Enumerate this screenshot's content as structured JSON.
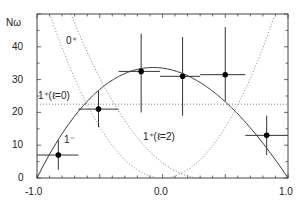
{
  "chart_data": {
    "type": "scatter",
    "title": "",
    "xlabel": "",
    "ylabel": "Nω",
    "xlim": [
      -1.0,
      1.0
    ],
    "ylim": [
      0,
      50
    ],
    "x_ticks": [
      "-1.0",
      "0.0",
      "1.0"
    ],
    "y_ticks": [
      "0",
      "10",
      "20",
      "30",
      "40"
    ],
    "grid": false,
    "legend": null,
    "series": [
      {
        "name": "data",
        "style": "points-with-errorbars",
        "x": [
          -0.83,
          -0.51,
          -0.17,
          0.16,
          0.5,
          0.83
        ],
        "y": [
          7,
          21,
          32.5,
          31,
          31.5,
          13
        ],
        "x_err_low": [
          -1.0,
          -0.67,
          -0.35,
          -0.02,
          0.3,
          0.66
        ],
        "x_err_high": [
          -0.67,
          -0.35,
          -0.02,
          0.3,
          0.66,
          1.0
        ],
        "y_err_low": [
          2.5,
          15.5,
          20,
          19,
          23.5,
          7
        ],
        "y_err_high": [
          11.5,
          26.5,
          44,
          43,
          46,
          19
        ]
      },
      {
        "name": "1⁻",
        "style": "solid",
        "function": "33.5*(1-w^2) skewed, zero at ±1, peak ≈33.5 near w=-0.15"
      },
      {
        "name": "0⁺",
        "style": "dotted",
        "function": "rises steeply toward w=-1, falls to 0 near w≈0.3"
      },
      {
        "name": "1⁺(ℓ=0)",
        "style": "dotted",
        "constant": 22.5
      },
      {
        "name": "1⁺(ℓ=2)",
        "style": "dotted",
        "function": "parabola ~ w^2 shape, minimum 0 near w=0, rising to ~50 at w≈±0.9"
      }
    ],
    "annotations": [
      {
        "text": "0⁺",
        "x": -0.68,
        "y": 43
      },
      {
        "text": "1⁺(ℓ=0)",
        "x": -0.99,
        "y": 24.5
      },
      {
        "text": "1⁻",
        "x": -0.78,
        "y": 11.5
      },
      {
        "text": "1⁺(ℓ=2)",
        "x": -0.15,
        "y": 12.5
      }
    ]
  },
  "axes": {
    "y_label": "Nω",
    "x_tick_labels": [
      "-1.0",
      "0.0",
      "1.0"
    ],
    "y_tick_labels": [
      "0",
      "10",
      "20",
      "30",
      "40"
    ]
  },
  "labels": {
    "zero_plus": "0⁺",
    "one_plus_l0": "1⁺(ℓ=0)",
    "one_minus": "1⁻",
    "one_plus_l2": "1⁺(ℓ=2)"
  }
}
